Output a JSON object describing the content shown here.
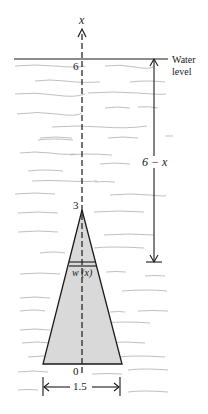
{
  "diagram": {
    "axis_label": "x",
    "water_level_label_line1": "Water",
    "water_level_label_line2": "level",
    "tick_top": "6",
    "tick_apex": "3",
    "tick_origin": "0",
    "depth_label": "6 − x",
    "strip_label": "w (x)",
    "base_width_label": "1.5",
    "colors": {
      "line": "#1a1a1a",
      "plate_fill": "#d9d9d9",
      "wave": "#b5b5b5"
    }
  }
}
